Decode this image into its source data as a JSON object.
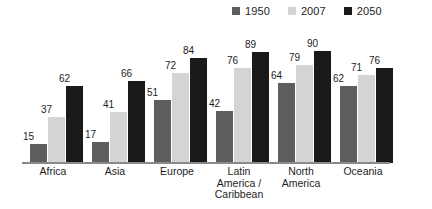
{
  "chart_data": {
    "type": "bar",
    "title": "",
    "subtitle": "",
    "xlabel": "",
    "ylabel": "",
    "ylim": [
      0,
      100
    ],
    "grid": false,
    "legend_position": "top-right",
    "categories": [
      "Africa",
      "Asia",
      "Europe",
      "Latin\nAmerica /\nCaribbean",
      "North\nAmerica",
      "Oceania"
    ],
    "series": [
      {
        "name": "1950",
        "color": "#5e5e5e",
        "values": [
          15,
          17,
          51,
          42,
          64,
          62
        ]
      },
      {
        "name": "2007",
        "color": "#d4d4d4",
        "values": [
          37,
          41,
          72,
          76,
          79,
          71
        ]
      },
      {
        "name": "2050",
        "color": "#1a1a1a",
        "values": [
          62,
          66,
          84,
          89,
          90,
          76
        ]
      }
    ],
    "data_labels": [
      {
        "category": "Africa",
        "values": [
          15,
          37,
          62
        ]
      },
      {
        "category": "Asia",
        "values": [
          17,
          41,
          66
        ]
      },
      {
        "category": "Europe",
        "values": [
          51,
          72,
          84
        ]
      },
      {
        "category": "Latin America / Caribbean",
        "values": [
          42,
          76,
          89
        ]
      },
      {
        "category": "North America",
        "values": [
          64,
          79,
          90
        ]
      },
      {
        "category": "Oceania",
        "values": [
          62,
          71,
          76
        ]
      }
    ]
  },
  "legend": {
    "items": [
      {
        "label": "1950",
        "color": "#5e5e5e"
      },
      {
        "label": "2007",
        "color": "#d4d4d4"
      },
      {
        "label": "2050",
        "color": "#1a1a1a"
      }
    ]
  },
  "axis": {
    "baseline_color": "#8a8a8a"
  }
}
